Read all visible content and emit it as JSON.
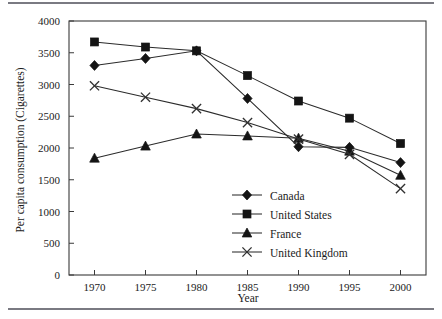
{
  "chart_data": {
    "type": "line",
    "title": "",
    "xlabel": "Year",
    "ylabel": "Per capita consumption (Cigarettes)",
    "x": [
      1970,
      1975,
      1980,
      1985,
      1990,
      1995,
      2000
    ],
    "xticklabels": [
      "1970",
      "1975",
      "1980",
      "1985",
      "1990",
      "1995",
      "2000"
    ],
    "yticklabels": [
      "0",
      "500",
      "1000",
      "1500",
      "2000",
      "2500",
      "3000",
      "3500",
      "4000"
    ],
    "yticks": [
      0,
      500,
      1000,
      1500,
      2000,
      2500,
      3000,
      3500,
      4000
    ],
    "xlim": [
      1967.5,
      2002.5
    ],
    "ylim": [
      0,
      4000
    ],
    "grid": false,
    "legend_position": "lower-right-inside",
    "series": [
      {
        "name": "Canada",
        "marker": "diamond",
        "values": [
          3300,
          3410,
          3530,
          2780,
          2020,
          2010,
          1770
        ]
      },
      {
        "name": "United States",
        "marker": "square",
        "values": [
          3670,
          3590,
          3530,
          3140,
          2740,
          2470,
          2070
        ]
      },
      {
        "name": "France",
        "marker": "triangle",
        "values": [
          1840,
          2030,
          2220,
          2190,
          2155,
          1950,
          1570
        ]
      },
      {
        "name": "United Kingdom",
        "marker": "x",
        "values": [
          2980,
          2800,
          2620,
          2400,
          2140,
          1900,
          1360
        ]
      }
    ]
  },
  "legend": {
    "items": [
      {
        "label": "Canada",
        "marker": "diamond"
      },
      {
        "label": "United States",
        "marker": "square"
      },
      {
        "label": "France",
        "marker": "triangle"
      },
      {
        "label": "United Kingdom",
        "marker": "x"
      }
    ]
  },
  "colors": {
    "ink": "#1b1b1b",
    "frame": "#3a3a3a",
    "line": "#2b2b2b",
    "rule": "#7a7a82",
    "background": "#ffffff"
  }
}
